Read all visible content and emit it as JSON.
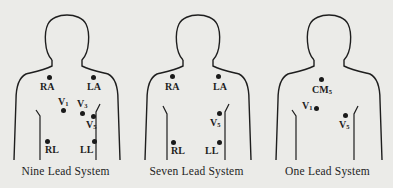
{
  "panels": [
    {
      "caption": "Nine Lead System",
      "electrodes": [
        {
          "id": "RA",
          "label": "RA",
          "sub": ""
        },
        {
          "id": "LA",
          "label": "LA",
          "sub": ""
        },
        {
          "id": "V1",
          "label": "V",
          "sub": "1"
        },
        {
          "id": "V3",
          "label": "V",
          "sub": "3"
        },
        {
          "id": "V5",
          "label": "V",
          "sub": "5"
        },
        {
          "id": "RL",
          "label": "RL",
          "sub": ""
        },
        {
          "id": "LL",
          "label": "LL",
          "sub": ""
        }
      ]
    },
    {
      "caption": "Seven Lead System",
      "electrodes": [
        {
          "id": "RA",
          "label": "RA",
          "sub": ""
        },
        {
          "id": "LA",
          "label": "LA",
          "sub": ""
        },
        {
          "id": "V5",
          "label": "V",
          "sub": "5"
        },
        {
          "id": "RL",
          "label": "RL",
          "sub": ""
        },
        {
          "id": "LL",
          "label": "LL",
          "sub": ""
        }
      ]
    },
    {
      "caption": "One Lead System",
      "electrodes": [
        {
          "id": "CM5",
          "label": "CM",
          "sub": "5"
        },
        {
          "id": "V1",
          "label": "V",
          "sub": "1"
        },
        {
          "id": "V5",
          "label": "V",
          "sub": "5"
        }
      ]
    }
  ]
}
